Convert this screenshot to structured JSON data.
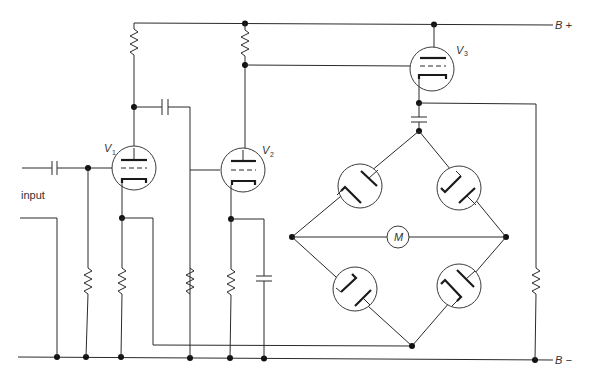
{
  "diagram": {
    "type": "vacuum-tube circuit schematic",
    "labels": {
      "input": "input",
      "b_plus": "B +",
      "b_minus": "B −",
      "motor": "M",
      "v1": "V",
      "v1_sub": "1",
      "v2": "V",
      "v2_sub": "2",
      "v3": "V",
      "v3_sub": "3"
    },
    "components": {
      "tubes": [
        "V1",
        "V2",
        "V3"
      ],
      "diode_bridge": [
        "D-top-left",
        "D-top-right",
        "D-bottom-left",
        "D-bottom-right"
      ],
      "meter": "M",
      "resistors": 7,
      "capacitors": 4
    },
    "colors": {
      "line": "#2a2a2a",
      "background": "#ffffff"
    }
  }
}
